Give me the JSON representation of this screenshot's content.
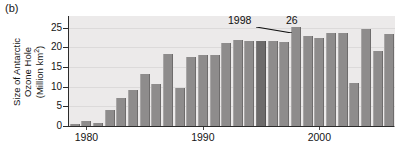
{
  "panel": {
    "label": "(b)"
  },
  "axes": {
    "ylabel_line1": "Size of Antarctic",
    "ylabel_line2_pre": "Ozone Hole",
    "ylabel_line3": "(Million km",
    "ylabel_sup": "2",
    "ylabel_close": ")",
    "ytick_labels": [
      "0",
      "5",
      "10",
      "15",
      "20",
      "25"
    ],
    "xtick_labels": [
      "1980",
      "1990",
      "2000"
    ]
  },
  "annotations": {
    "year_callout": "1998",
    "value_callout": "26"
  },
  "colors": {
    "plot_background": "#eceaea",
    "bar": "#8e8c8c",
    "bar_highlight": "#6d6b6b",
    "gridline": "#dcdada",
    "axis": "#2b2b2b",
    "text": "#151515"
  },
  "chart_data": {
    "type": "bar",
    "title": "",
    "subtitle": "",
    "xlabel": "",
    "ylabel": "Size of Antarctic Ozone Hole (Million km2)",
    "xlim": [
      1978.5,
      2006.5
    ],
    "ylim": [
      0,
      28
    ],
    "yticks": [
      0,
      5,
      10,
      15,
      20,
      25
    ],
    "xticks": [
      1980,
      1990,
      2000
    ],
    "grid": true,
    "legend": null,
    "highlight_year": 1995,
    "categories": [
      1979,
      1980,
      1981,
      1982,
      1983,
      1984,
      1985,
      1986,
      1987,
      1988,
      1989,
      1990,
      1991,
      1992,
      1993,
      1994,
      1995,
      1996,
      1997,
      1998,
      1999,
      2000,
      2001,
      2002,
      2003,
      2004,
      2005,
      2006
    ],
    "values": [
      0.4,
      1.3,
      0.7,
      4.2,
      7.2,
      9.1,
      13.2,
      10.6,
      18.3,
      9.7,
      17.6,
      18.2,
      18.2,
      21.2,
      21.9,
      21.6,
      21.7,
      21.6,
      21.3,
      25.1,
      22.8,
      22.5,
      23.8,
      23.8,
      11.0,
      24.7,
      19.0,
      23.5
    ],
    "value_labels": {
      "1998": 26
    },
    "annotations": [
      {
        "text": "1998",
        "target_year": 1998,
        "type": "leader-line"
      },
      {
        "text": "26",
        "target_year": 1998,
        "type": "value"
      }
    ]
  }
}
